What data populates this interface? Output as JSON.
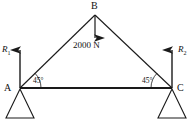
{
  "figure": {
    "type": "statics-truss-free-body-diagram",
    "stroke_color": "#1a1a1a",
    "background": "#ffffff"
  },
  "vertices": {
    "a": {
      "label": "A",
      "x": 20,
      "y": 88
    },
    "b": {
      "label": "B",
      "x": 95,
      "y": 15
    },
    "c": {
      "label": "C",
      "x": 172,
      "y": 88
    }
  },
  "members": [
    {
      "name": "member-ab",
      "from": "A",
      "to": "B"
    },
    {
      "name": "member-bc",
      "from": "B",
      "to": "C"
    },
    {
      "name": "member-ac",
      "from": "A",
      "to": "C"
    }
  ],
  "load": {
    "label": "2000 N",
    "magnitude": 2000,
    "unit": "N",
    "direction": "down",
    "applied_at": "B"
  },
  "reactions": [
    {
      "name": "reaction-left",
      "label": "R",
      "subscript": "1",
      "direction": "up",
      "applied_at": "A"
    },
    {
      "name": "reaction-right",
      "label": "R",
      "subscript": "2",
      "direction": "up",
      "applied_at": "C"
    }
  ],
  "angles": [
    {
      "name": "angle-at-a",
      "label": "45°",
      "value": 45,
      "unit": "deg",
      "at": "A"
    },
    {
      "name": "angle-at-c",
      "label": "45°",
      "value": 45,
      "unit": "deg",
      "at": "C"
    }
  ],
  "supports": [
    {
      "name": "support-left",
      "type": "triangle",
      "at": "A"
    },
    {
      "name": "support-right",
      "type": "triangle",
      "at": "C"
    }
  ]
}
